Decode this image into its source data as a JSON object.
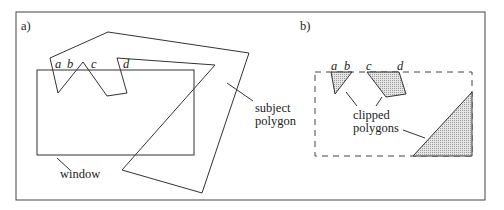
{
  "figure": {
    "panel_a": {
      "label": "a)",
      "vertex_labels": [
        "a",
        "b",
        "c",
        "d"
      ],
      "window_label": "window",
      "subject_label_line1": "subject",
      "subject_label_line2": "polygon"
    },
    "panel_b": {
      "label": "b)",
      "vertex_labels": [
        "a",
        "b",
        "c",
        "d"
      ],
      "clipped_label_line1": "clipped",
      "clipped_label_line2": "polygons"
    },
    "colors": {
      "line": "#333333",
      "clipped_fill": "#c8c8c8",
      "background": "#ffffff"
    }
  }
}
